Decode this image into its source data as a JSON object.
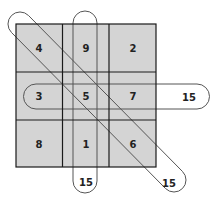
{
  "diagram": {
    "title": "",
    "grid": {
      "rows": [
        [
          "4",
          "9",
          "2"
        ],
        [
          "3",
          "5",
          "7"
        ],
        [
          "8",
          "1",
          "6"
        ]
      ]
    },
    "sums": {
      "row_middle": "15",
      "column_middle": "15",
      "diagonal_main": "15"
    },
    "colors": {
      "cell_fill": "#d4d4d4",
      "grid_line": "#1a1a1a",
      "capsule_stroke": "#555555",
      "background": "#ffffff"
    }
  }
}
